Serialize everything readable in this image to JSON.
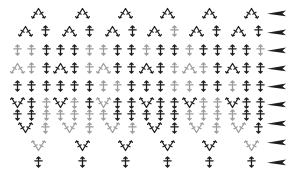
{
  "canvas": {
    "width": 288,
    "height": 184,
    "background": "#ffffff"
  },
  "palette": {
    "dark": "#1e1e1e",
    "gray": "#9c9c9c"
  },
  "chart_data": {
    "type": "crochet-stitch-diagram",
    "symbols": {
      "sc": "single-crochet-plus",
      "dec": "sc2tog-decrease-inverted-v",
      "inc": "2sc-increase-v",
      "arrow": "row-direction-arrow"
    },
    "peak_xs": [
      38,
      82,
      125,
      167,
      209,
      251
    ],
    "rows": [
      {
        "y": 13,
        "stitches": [
          [
            38,
            "dec",
            "dark"
          ],
          [
            82,
            "dec",
            "dark"
          ],
          [
            125,
            "dec",
            "dark"
          ],
          [
            167,
            "dec",
            "dark"
          ],
          [
            209,
            "dec",
            "dark"
          ],
          [
            251,
            "dec",
            "dark"
          ]
        ]
      },
      {
        "y": 31,
        "stitches": [
          [
            25,
            "dec",
            "dark"
          ],
          [
            45,
            "sc",
            "dark"
          ],
          [
            69,
            "dec",
            "dark"
          ],
          [
            89,
            "sc",
            "dark"
          ],
          [
            112,
            "dec",
            "dark"
          ],
          [
            132,
            "sc",
            "dark"
          ],
          [
            154,
            "dec",
            "dark"
          ],
          [
            174,
            "sc",
            "gray"
          ],
          [
            196,
            "dec",
            "dark"
          ],
          [
            216,
            "sc",
            "dark"
          ],
          [
            238,
            "dec",
            "dark"
          ],
          [
            258,
            "sc",
            "dark"
          ]
        ]
      },
      {
        "y": 50,
        "stitches": [
          [
            17,
            "sc",
            "gray"
          ],
          [
            31,
            "sc",
            "gray"
          ],
          [
            46,
            "sc",
            "dark"
          ],
          [
            60,
            "sc",
            "dark"
          ],
          [
            74,
            "sc",
            "dark"
          ],
          [
            89,
            "sc",
            "gray"
          ],
          [
            103,
            "sc",
            "gray"
          ],
          [
            117,
            "sc",
            "dark"
          ],
          [
            131,
            "sc",
            "dark"
          ],
          [
            146,
            "sc",
            "gray"
          ],
          [
            160,
            "sc",
            "dark"
          ],
          [
            174,
            "sc",
            "dark"
          ],
          [
            189,
            "sc",
            "gray"
          ],
          [
            203,
            "sc",
            "dark"
          ],
          [
            217,
            "sc",
            "dark"
          ],
          [
            232,
            "sc",
            "dark"
          ],
          [
            246,
            "sc",
            "dark"
          ],
          [
            260,
            "sc",
            "gray"
          ]
        ]
      },
      {
        "y": 68,
        "stitches": [
          [
            17,
            "dec",
            "gray"
          ],
          [
            31,
            "sc",
            "gray"
          ],
          [
            46,
            "sc",
            "dark"
          ],
          [
            60,
            "dec",
            "dark"
          ],
          [
            74,
            "sc",
            "dark"
          ],
          [
            89,
            "sc",
            "gray"
          ],
          [
            103,
            "dec",
            "gray"
          ],
          [
            117,
            "sc",
            "dark"
          ],
          [
            131,
            "sc",
            "dark"
          ],
          [
            146,
            "dec",
            "dark"
          ],
          [
            160,
            "sc",
            "dark"
          ],
          [
            174,
            "sc",
            "gray"
          ],
          [
            189,
            "dec",
            "gray"
          ],
          [
            203,
            "sc",
            "gray"
          ],
          [
            217,
            "sc",
            "dark"
          ],
          [
            232,
            "dec",
            "dark"
          ],
          [
            246,
            "sc",
            "dark"
          ],
          [
            260,
            "sc",
            "dark"
          ]
        ]
      },
      {
        "y": 86,
        "stitches": [
          [
            17,
            "sc",
            "dark"
          ],
          [
            31,
            "sc",
            "dark"
          ],
          [
            46,
            "sc",
            "dark"
          ],
          [
            60,
            "sc",
            "dark"
          ],
          [
            74,
            "sc",
            "dark"
          ],
          [
            89,
            "sc",
            "dark"
          ],
          [
            103,
            "sc",
            "gray"
          ],
          [
            117,
            "sc",
            "gray"
          ],
          [
            131,
            "sc",
            "dark"
          ],
          [
            146,
            "sc",
            "dark"
          ],
          [
            160,
            "sc",
            "dark"
          ],
          [
            174,
            "sc",
            "gray"
          ],
          [
            189,
            "sc",
            "gray"
          ],
          [
            203,
            "sc",
            "dark"
          ],
          [
            217,
            "sc",
            "dark"
          ],
          [
            232,
            "sc",
            "gray"
          ],
          [
            246,
            "sc",
            "dark"
          ],
          [
            260,
            "sc",
            "dark"
          ]
        ]
      },
      {
        "y": 103,
        "stitches": [
          [
            17,
            "inc",
            "dark"
          ],
          [
            31,
            "sc",
            "dark"
          ],
          [
            46,
            "sc",
            "gray"
          ],
          [
            60,
            "inc",
            "dark"
          ],
          [
            74,
            "sc",
            "gray"
          ],
          [
            89,
            "sc",
            "dark"
          ],
          [
            103,
            "inc",
            "gray"
          ],
          [
            117,
            "sc",
            "dark"
          ],
          [
            131,
            "sc",
            "dark"
          ],
          [
            146,
            "inc",
            "dark"
          ],
          [
            160,
            "sc",
            "dark"
          ],
          [
            174,
            "sc",
            "dark"
          ],
          [
            189,
            "inc",
            "dark"
          ],
          [
            203,
            "sc",
            "gray"
          ],
          [
            217,
            "sc",
            "gray"
          ],
          [
            232,
            "inc",
            "dark"
          ],
          [
            246,
            "sc",
            "dark"
          ],
          [
            260,
            "sc",
            "dark"
          ]
        ]
      },
      {
        "y": 115,
        "stitches": [
          [
            17,
            "sc",
            "dark"
          ],
          [
            31,
            "sc",
            "dark"
          ],
          [
            46,
            "sc",
            "gray"
          ],
          [
            60,
            "sc",
            "gray"
          ],
          [
            74,
            "sc",
            "gray"
          ],
          [
            89,
            "sc",
            "gray"
          ],
          [
            103,
            "sc",
            "gray"
          ],
          [
            117,
            "sc",
            "dark"
          ],
          [
            131,
            "sc",
            "dark"
          ],
          [
            146,
            "sc",
            "dark"
          ],
          [
            160,
            "sc",
            "dark"
          ],
          [
            174,
            "sc",
            "dark"
          ],
          [
            189,
            "sc",
            "gray"
          ],
          [
            203,
            "sc",
            "gray"
          ],
          [
            217,
            "sc",
            "gray"
          ],
          [
            232,
            "sc",
            "gray"
          ],
          [
            246,
            "sc",
            "dark"
          ],
          [
            260,
            "sc",
            "dark"
          ]
        ]
      },
      {
        "y": 128,
        "stitches": [
          [
            25,
            "inc",
            "dark"
          ],
          [
            45,
            "sc",
            "gray"
          ],
          [
            69,
            "inc",
            "gray"
          ],
          [
            89,
            "sc",
            "gray"
          ],
          [
            112,
            "inc",
            "gray"
          ],
          [
            132,
            "sc",
            "gray"
          ],
          [
            154,
            "inc",
            "dark"
          ],
          [
            174,
            "sc",
            "dark"
          ],
          [
            196,
            "inc",
            "gray"
          ],
          [
            216,
            "sc",
            "gray"
          ],
          [
            238,
            "inc",
            "gray"
          ],
          [
            258,
            "sc",
            "dark"
          ]
        ]
      },
      {
        "y": 146,
        "stitches": [
          [
            38,
            "inc",
            "gray"
          ],
          [
            82,
            "inc",
            "dark"
          ],
          [
            125,
            "inc",
            "dark"
          ],
          [
            167,
            "inc",
            "dark"
          ],
          [
            209,
            "inc",
            "dark"
          ],
          [
            251,
            "inc",
            "gray"
          ]
        ]
      },
      {
        "y": 162,
        "stitches": [
          [
            38,
            "sc",
            "dark"
          ],
          [
            82,
            "sc",
            "dark"
          ],
          [
            125,
            "sc",
            "dark"
          ],
          [
            167,
            "sc",
            "dark"
          ],
          [
            209,
            "sc",
            "dark"
          ],
          [
            251,
            "sc",
            "dark"
          ]
        ]
      }
    ],
    "direction_arrows": {
      "x": 267,
      "color": "dark",
      "ys": [
        13,
        32,
        50,
        68,
        86,
        104,
        123,
        142,
        162
      ]
    }
  }
}
